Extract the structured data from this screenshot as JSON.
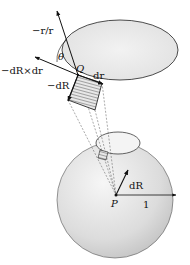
{
  "figure": {
    "labels": {
      "neg_r_over_r": "−r/r",
      "theta": "θ",
      "neg_dR_cross_dr": "−dR×dr",
      "Q": "Q",
      "dr": "dr",
      "neg_dR": "−dR",
      "dR": "dR",
      "P": "P",
      "radius": "1"
    },
    "colors": {
      "background": "#ffffff",
      "surface_fill": "#e6e6e6",
      "sphere_fill": "#dcdcdc",
      "stroke": "#111111",
      "dashed": "#555555"
    }
  }
}
